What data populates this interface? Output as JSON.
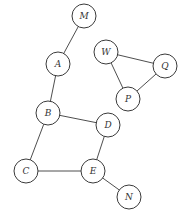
{
  "diagram": {
    "type": "undirected-graph",
    "node_radius": 12,
    "colors": {
      "stroke": "#3a3a3a",
      "fill": "#ffffff",
      "label": "#333333"
    },
    "nodes": [
      {
        "id": "M",
        "label": "M",
        "x": 84,
        "y": 16
      },
      {
        "id": "A",
        "label": "A",
        "x": 58,
        "y": 64
      },
      {
        "id": "W",
        "label": "W",
        "x": 106,
        "y": 52
      },
      {
        "id": "Q",
        "label": "Q",
        "x": 165,
        "y": 66
      },
      {
        "id": "P",
        "label": "P",
        "x": 128,
        "y": 99
      },
      {
        "id": "B",
        "label": "B",
        "x": 48,
        "y": 113
      },
      {
        "id": "D",
        "label": "D",
        "x": 108,
        "y": 125
      },
      {
        "id": "C",
        "label": "C",
        "x": 26,
        "y": 171
      },
      {
        "id": "E",
        "label": "E",
        "x": 93,
        "y": 171
      },
      {
        "id": "N",
        "label": "N",
        "x": 129,
        "y": 197
      }
    ],
    "edges": [
      {
        "from": "M",
        "to": "A"
      },
      {
        "from": "A",
        "to": "B"
      },
      {
        "from": "W",
        "to": "Q"
      },
      {
        "from": "W",
        "to": "P"
      },
      {
        "from": "Q",
        "to": "P"
      },
      {
        "from": "B",
        "to": "D"
      },
      {
        "from": "B",
        "to": "C"
      },
      {
        "from": "D",
        "to": "E"
      },
      {
        "from": "C",
        "to": "E"
      },
      {
        "from": "E",
        "to": "N"
      }
    ]
  }
}
